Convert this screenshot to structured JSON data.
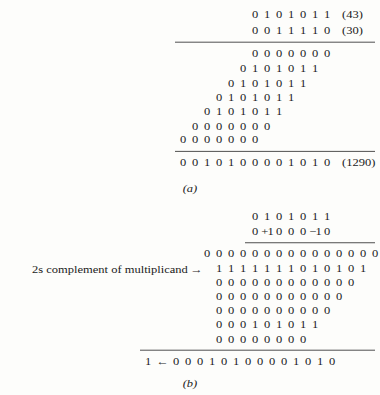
{
  "figure": {
    "part_a": {
      "caption": "(a)",
      "multiplicand": {
        "digits": "0 1 0 1 0 1 1",
        "decimal": "(43)"
      },
      "multiplier": {
        "digits": "0 0 1 1 1 1 0",
        "decimal": "(30)"
      },
      "partial_products": [
        "0 0 0 0 0 0 0",
        "0 1 0 1 0 1 1",
        "0 1 0 1 0 1 1",
        "0 1 0 1 0 1 1",
        "0 1 0 1 0 1 1",
        "0 0 0 0 0 0 0",
        "0 0 0 0 0 0 0"
      ],
      "product": {
        "digits": "0 0 1 0 1 0 0 0 0 1 0 1 0",
        "decimal": "(1290)"
      }
    },
    "part_b": {
      "caption": "(b)",
      "multiplicand": "0 1 0 1 0 1 1",
      "booth_multiplier": "0 +1 0 0 0 -1 0",
      "annotation": "2s complement of multiplicand",
      "annotation_arrow": "→",
      "partial_products": [
        "0 0 0 0 0 0 0 0 0 0 0 0 0 0 0",
        "1 1 1 1 1 1 1 0 1 0 1 0 1",
        "0 0 0 0 0 0 0 0 0 0 0 0",
        "0 0 0 0 0 0 0 0 0 0 0",
        "0 0 0 0 0 0 0 0 0 0",
        "0 0 0 1 0 1 0 1 1",
        "0 0 0 0 0 0 0 0"
      ],
      "result_carry": "1",
      "result_arrow": "←",
      "result": "0 0 0 1 0 1 0 0 0 0 1 0 1 0"
    }
  }
}
